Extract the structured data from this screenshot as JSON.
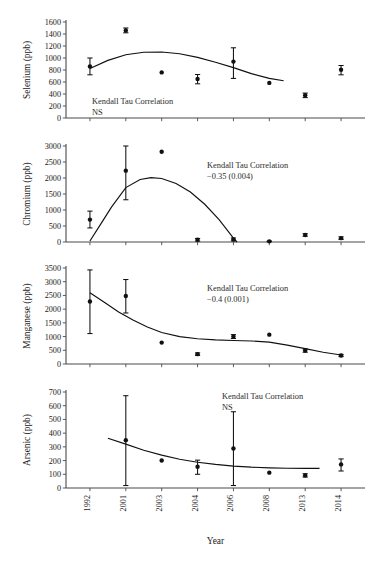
{
  "figure": {
    "xlabel": "Year",
    "x_categories": [
      "1992",
      "2001",
      "2003",
      "2004",
      "2006",
      "2008",
      "2013",
      "2014"
    ],
    "line_color": "#111111",
    "marker_color": "#111111"
  },
  "chart_data": [
    {
      "type": "scatter",
      "panel": "selenium",
      "title": "",
      "ylabel": "Selenium (ppb)",
      "xlabel": "",
      "ylim": [
        0,
        1600
      ],
      "yticks": [
        0,
        200,
        400,
        600,
        800,
        1000,
        1200,
        1400,
        1600
      ],
      "grid": false,
      "categories": [
        "1992",
        "2001",
        "2003",
        "2004",
        "2006",
        "2008",
        "2013",
        "2014"
      ],
      "values": [
        860,
        1460,
        760,
        650,
        940,
        585,
        380,
        805
      ],
      "err_low": [
        140,
        40,
        0,
        80,
        280,
        0,
        40,
        85
      ],
      "err_high": [
        140,
        40,
        0,
        75,
        230,
        0,
        35,
        70
      ],
      "annotation": [
        "Kendall Tau Correlation",
        "NS"
      ],
      "trend": [
        [
          0,
          825
        ],
        [
          0.5,
          960
        ],
        [
          1,
          1055
        ],
        [
          1.5,
          1095
        ],
        [
          2,
          1100
        ],
        [
          2.5,
          1070
        ],
        [
          3,
          1010
        ],
        [
          3.5,
          930
        ],
        [
          4,
          840
        ],
        [
          4.5,
          740
        ],
        [
          5,
          660
        ],
        [
          5.4,
          620
        ]
      ]
    },
    {
      "type": "scatter",
      "panel": "chromium",
      "title": "",
      "ylabel": "Chromium (ppb)",
      "xlabel": "",
      "ylim": [
        0,
        3000
      ],
      "yticks": [
        0,
        500,
        1000,
        1500,
        2000,
        2500,
        3000
      ],
      "grid": false,
      "categories": [
        "1992",
        "2001",
        "2003",
        "2004",
        "2006",
        "2008",
        "2013",
        "2014"
      ],
      "values": [
        700,
        2230,
        2820,
        70,
        80,
        20,
        220,
        120
      ],
      "err_low": [
        260,
        910,
        0,
        40,
        45,
        10,
        40,
        40
      ],
      "err_high": [
        265,
        820,
        0,
        40,
        45,
        10,
        40,
        40
      ],
      "annotation": [
        "Kendall Tau Correlation",
        "−0.35 (0.004)"
      ],
      "trend": [
        [
          0,
          30
        ],
        [
          0.3,
          560
        ],
        [
          0.6,
          1090
        ],
        [
          1,
          1700
        ],
        [
          1.4,
          1955
        ],
        [
          1.7,
          2010
        ],
        [
          2,
          1985
        ],
        [
          2.4,
          1830
        ],
        [
          2.8,
          1560
        ],
        [
          3.2,
          1180
        ],
        [
          3.6,
          700
        ],
        [
          4,
          120
        ],
        [
          4.1,
          0
        ]
      ]
    },
    {
      "type": "scatter",
      "panel": "manganese",
      "title": "",
      "ylabel": "Manganese (ppb)",
      "xlabel": "",
      "ylim": [
        0,
        3500
      ],
      "yticks": [
        0,
        500,
        1000,
        1500,
        2000,
        2500,
        3000,
        3500
      ],
      "grid": false,
      "categories": [
        "1992",
        "2001",
        "2003",
        "2004",
        "2006",
        "2008",
        "2013",
        "2014"
      ],
      "values": [
        2280,
        2480,
        780,
        360,
        1000,
        1070,
        490,
        310
      ],
      "err_low": [
        1170,
        620,
        0,
        45,
        70,
        0,
        60,
        40
      ],
      "err_high": [
        1150,
        600,
        0,
        45,
        70,
        0,
        60,
        40
      ],
      "annotation": [
        "Kendall Tau Correlation",
        "−0.4 (0.001)"
      ],
      "trend": [
        [
          0,
          2600
        ],
        [
          0.4,
          2250
        ],
        [
          0.8,
          1900
        ],
        [
          1.2,
          1600
        ],
        [
          1.6,
          1350
        ],
        [
          2,
          1150
        ],
        [
          2.5,
          1000
        ],
        [
          3,
          920
        ],
        [
          3.5,
          880
        ],
        [
          4,
          855
        ],
        [
          4.5,
          840
        ],
        [
          5,
          800
        ],
        [
          5.5,
          690
        ],
        [
          6,
          560
        ],
        [
          6.5,
          430
        ],
        [
          7,
          330
        ]
      ]
    },
    {
      "type": "scatter",
      "panel": "arsenic",
      "title": "",
      "ylabel": "Arsenic (ppb)",
      "xlabel": "Year",
      "ylim": [
        0,
        700
      ],
      "yticks": [
        0,
        100,
        200,
        300,
        400,
        500,
        600,
        700
      ],
      "grid": false,
      "categories": [
        "1992",
        "2001",
        "2003",
        "2004",
        "2006",
        "2008",
        "2013",
        "2014"
      ],
      "values": [
        null,
        348,
        200,
        155,
        288,
        112,
        92,
        172
      ],
      "err_low": [
        0,
        330,
        0,
        55,
        270,
        0,
        12,
        48
      ],
      "err_high": [
        0,
        325,
        0,
        48,
        268,
        0,
        12,
        40
      ],
      "annotation": [
        "Kendall Tau Correlation",
        "NS"
      ],
      "trend": [
        [
          0.5,
          363
        ],
        [
          1,
          320
        ],
        [
          1.5,
          275
        ],
        [
          2,
          240
        ],
        [
          2.5,
          210
        ],
        [
          3,
          188
        ],
        [
          3.5,
          172
        ],
        [
          4,
          160
        ],
        [
          4.5,
          152
        ],
        [
          5,
          147
        ],
        [
          5.5,
          144
        ],
        [
          6,
          143
        ],
        [
          6.4,
          143
        ]
      ]
    }
  ]
}
